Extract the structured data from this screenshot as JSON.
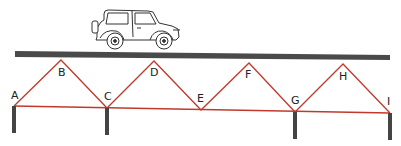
{
  "diagram": {
    "colors": {
      "deck": "#4a4a4a",
      "truss": "#c0392b",
      "post": "#444444",
      "vehicle": "#333333"
    },
    "joints": [
      {
        "label": "A",
        "x": 14,
        "y": 106
      },
      {
        "label": "B",
        "x": 61,
        "y": 60
      },
      {
        "label": "C",
        "x": 107,
        "y": 108
      },
      {
        "label": "D",
        "x": 154,
        "y": 61
      },
      {
        "label": "E",
        "x": 201,
        "y": 110
      },
      {
        "label": "F",
        "x": 249,
        "y": 63
      },
      {
        "label": "G",
        "x": 295,
        "y": 112
      },
      {
        "label": "H",
        "x": 343,
        "y": 64
      },
      {
        "label": "I",
        "x": 390,
        "y": 113
      }
    ],
    "supports": [
      "A",
      "C",
      "G",
      "I"
    ],
    "vehicle": "jeep"
  }
}
